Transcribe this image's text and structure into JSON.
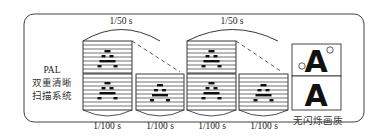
{
  "system_label": {
    "line1": "PAL",
    "line2": "双重清晰",
    "line3": "扫描系统"
  },
  "frame_intervals": [
    "1/50 s",
    "1/50 s"
  ],
  "field_intervals": [
    "1/100 s",
    "1/100 s",
    "1/100 s",
    "1/100 s"
  ],
  "result_label": "无闪烁画质",
  "glyph": "A",
  "colors": {
    "line": "#222222",
    "border": "#444444",
    "background": "#ffffff"
  }
}
